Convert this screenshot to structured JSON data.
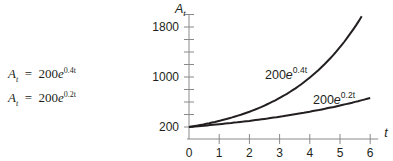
{
  "formulas": [
    {
      "lhs": "A",
      "lhs_sub": "t",
      "eq": "=",
      "coef": "200",
      "base": "e",
      "exp": "0.4t"
    },
    {
      "lhs": "A",
      "lhs_sub": "t",
      "eq": "=",
      "coef": "200",
      "base": "e",
      "exp": "0.2t"
    }
  ],
  "chart_data": {
    "type": "line",
    "title": "",
    "xlabel": "t",
    "ylabel": "A_t",
    "x_ticks": [
      "0",
      "1",
      "2",
      "3",
      "4",
      "5",
      "6"
    ],
    "y_tick_labels": [
      "200",
      "1000",
      "1800"
    ],
    "y_minor_tick_step": 200,
    "xlim": [
      0,
      6
    ],
    "ylim": [
      0,
      1900
    ],
    "grid": false,
    "legend": "inline labels on curves",
    "series": [
      {
        "name": "200e^{0.4t}",
        "label_coef": "200",
        "label_base": "e",
        "label_exp": "0.4t",
        "x": [
          0,
          1,
          2,
          3,
          4,
          5,
          5.7
        ],
        "values": [
          200,
          298,
          445,
          664,
          991,
          1478,
          1956
        ]
      },
      {
        "name": "200e^{0.2t}",
        "label_coef": "200",
        "label_base": "e",
        "label_exp": "0.2t",
        "x": [
          0,
          1,
          2,
          3,
          4,
          5,
          6
        ],
        "values": [
          200,
          244,
          298,
          364,
          445,
          544,
          664
        ]
      }
    ]
  }
}
